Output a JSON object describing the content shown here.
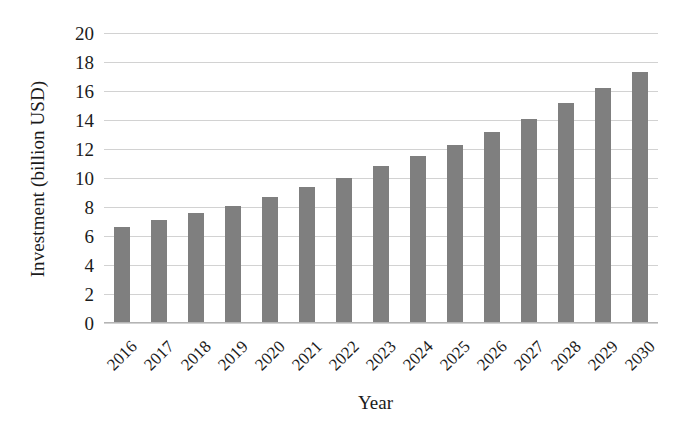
{
  "chart_data": {
    "type": "bar",
    "title": "",
    "subtitle": "",
    "xlabel": "Year",
    "ylabel": "Investment (billion USD)",
    "categories": [
      "2016",
      "2017",
      "2018",
      "2019",
      "2020",
      "2021",
      "2022",
      "2023",
      "2024",
      "2025",
      "2026",
      "2027",
      "2028",
      "2029",
      "2030"
    ],
    "values": [
      6.6,
      7.1,
      7.6,
      8.1,
      8.7,
      9.4,
      10.0,
      10.8,
      11.5,
      12.3,
      13.2,
      14.1,
      15.2,
      16.2,
      17.3
    ],
    "series": [
      {
        "name": "Investment",
        "values": [
          6.6,
          7.1,
          7.6,
          8.1,
          8.7,
          9.4,
          10.0,
          10.8,
          11.5,
          12.3,
          13.2,
          14.1,
          15.2,
          16.2,
          17.3
        ]
      }
    ],
    "ylim": [
      0,
      20
    ],
    "ytick_step": 2,
    "yticks": [
      0,
      2,
      4,
      6,
      8,
      10,
      12,
      14,
      16,
      18,
      20
    ],
    "ytick_labels": [
      "0",
      "2",
      "4",
      "6",
      "8",
      "10",
      "12",
      "14",
      "16",
      "18",
      "20"
    ],
    "grid": "horizontal",
    "legend": "none",
    "xtick_rotation_deg": -45,
    "bar_color": "#7f7f7f",
    "gridline_color": "#d2d2d2",
    "background_color": "#ffffff",
    "annotations": []
  }
}
